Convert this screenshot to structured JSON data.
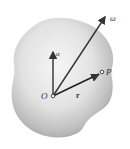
{
  "diagram": {
    "labels": {
      "origin": "O",
      "point": "P",
      "position_vector": "r",
      "angular_velocity": "ω",
      "angular_acceleration": "α"
    },
    "colors": {
      "body_light": "#f4f4f4",
      "body_dark": "#a8a8a8",
      "arrow": "#333333"
    }
  }
}
